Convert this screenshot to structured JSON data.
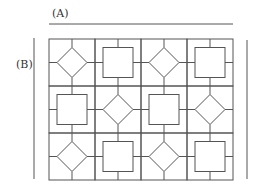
{
  "labels": {
    "a": "(A)",
    "b": "(B)"
  },
  "grid": {
    "rows": 3,
    "cols": 4,
    "cells": [
      [
        "diamond",
        "square",
        "diamond",
        "square"
      ],
      [
        "square",
        "diamond",
        "square",
        "diamond"
      ],
      [
        "diamond",
        "square",
        "diamond",
        "square"
      ]
    ]
  },
  "colors": {
    "stroke": "#555555",
    "background": "#ffffff"
  }
}
